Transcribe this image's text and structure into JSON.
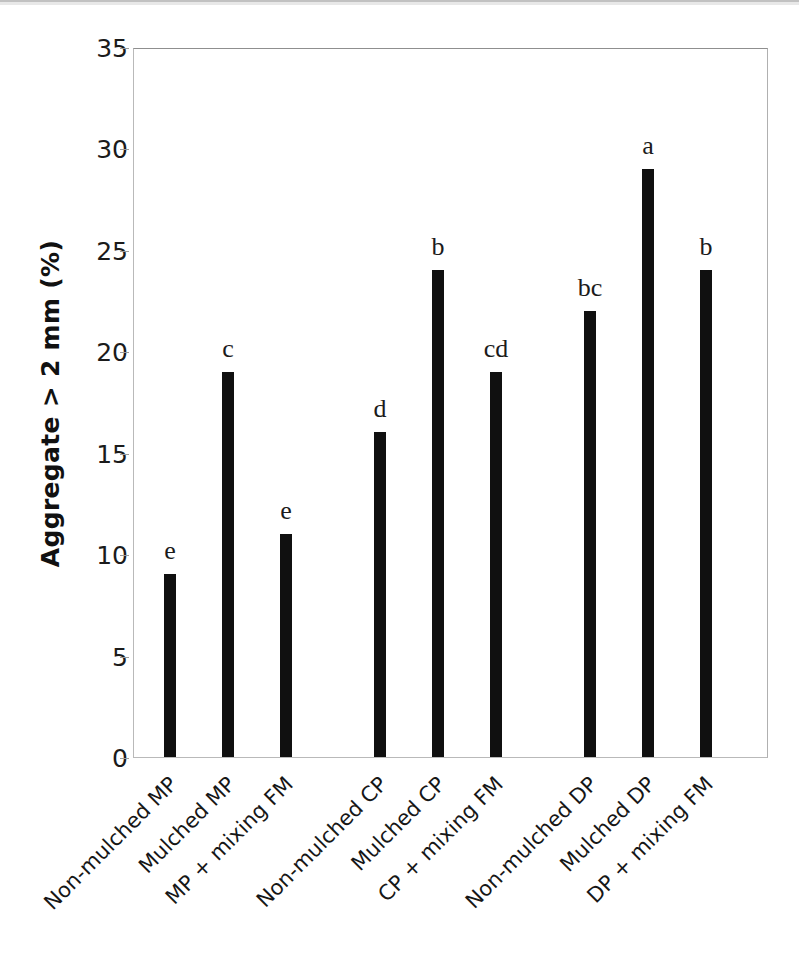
{
  "chart_data": {
    "type": "bar",
    "title": "",
    "subtitle": "",
    "xlabel": "",
    "ylabel": "Aggregate > 2 mm (%)",
    "ylim": [
      0,
      35
    ],
    "ytick_step": 5,
    "yticks": [
      "0",
      "5",
      "10",
      "15",
      "20",
      "25",
      "30",
      "35"
    ],
    "grid": false,
    "legend": "none",
    "bar_color": "#101010",
    "categories": [
      "Non-mulched MP",
      "Mulched MP",
      "MP + mixing FM",
      "Non-mulched CP",
      "Mulched CP",
      "CP + mixing FM",
      "Non-mulched DP",
      "Mulched DP",
      "DP + mixing FM"
    ],
    "values": [
      9,
      19,
      11,
      16,
      24,
      19,
      22,
      29,
      24
    ],
    "annotations": [
      "e",
      "c",
      "e",
      "d",
      "b",
      "cd",
      "bc",
      "a",
      "b"
    ],
    "groups": [
      "MP",
      "MP",
      "MP",
      "CP",
      "CP",
      "CP",
      "DP",
      "DP",
      "DP"
    ]
  }
}
